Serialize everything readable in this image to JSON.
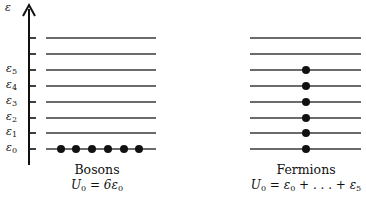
{
  "axis": {
    "label": "ε",
    "tick_labels": [
      {
        "main": "ε",
        "sub": "0"
      },
      {
        "main": "ε",
        "sub": "1"
      },
      {
        "main": "ε",
        "sub": "2"
      },
      {
        "main": "ε",
        "sub": "3"
      },
      {
        "main": "ε",
        "sub": "4"
      },
      {
        "main": "ε",
        "sub": "5"
      }
    ]
  },
  "levels_y": [
    149,
    133,
    118,
    102,
    86,
    70,
    54,
    38
  ],
  "bosons": {
    "title": "Bosons",
    "formula": {
      "lhs": "U",
      "lhs_sub": "0",
      "rhs": " = 6ε",
      "rhs_sub": "0"
    },
    "particles": [
      {
        "level": 0,
        "count": 6
      }
    ]
  },
  "fermions": {
    "title": "Fermions",
    "formula": {
      "lhs": "U",
      "lhs_sub": "0",
      "mid": " = ε",
      "mid_sub": "0",
      "rest": " + . . . + ε",
      "rest_sub": "5"
    },
    "particles": [
      {
        "level": 0
      },
      {
        "level": 1
      },
      {
        "level": 2
      },
      {
        "level": 3
      },
      {
        "level": 4
      },
      {
        "level": 5
      }
    ]
  },
  "colors": {
    "ink": "#111111",
    "line": "#3a3a3a"
  }
}
